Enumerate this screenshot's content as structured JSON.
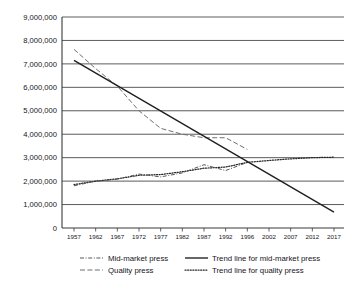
{
  "chart_data": {
    "type": "line",
    "title": "",
    "xlabel": "",
    "ylabel": "",
    "grid": "horizontal",
    "legend_position": "bottom",
    "ylim": [
      0,
      9000000
    ],
    "yticks": [
      0,
      1000000,
      2000000,
      3000000,
      4000000,
      5000000,
      6000000,
      7000000,
      8000000,
      9000000
    ],
    "ytick_labels": [
      "0",
      "1,000,000",
      "2,000,000",
      "3,000,000",
      "4,000,000",
      "5,000,000",
      "6,000,000",
      "7,000,000",
      "8,000,000",
      "9,000,000"
    ],
    "xtick_labels": [
      "1957",
      "1962",
      "1967",
      "1972",
      "1977",
      "1982",
      "1987",
      "1992",
      "1996",
      "2002",
      "2007",
      "2012",
      "2017"
    ],
    "x": [
      1957,
      1962,
      1967,
      1972,
      1977,
      1982,
      1987,
      1992,
      1996,
      2002,
      2007,
      2012,
      2017
    ],
    "series": [
      {
        "name": "Mid-market press",
        "style": "dash-dot",
        "x": [
          1957,
          1962,
          1967,
          1972,
          1977,
          1982,
          1987,
          1992,
          1996
        ],
        "values": [
          1800000,
          2000000,
          2080000,
          2300000,
          2180000,
          2350000,
          2700000,
          2450000,
          2800000
        ]
      },
      {
        "name": "Quality press",
        "style": "dashed",
        "x": [
          1957,
          1962,
          1967,
          1972,
          1977,
          1982,
          1987,
          1992,
          1996
        ],
        "values": [
          7620000,
          6800000,
          6050000,
          5000000,
          4250000,
          4000000,
          3850000,
          3850000,
          3350000
        ]
      },
      {
        "name": "Trend line for mid-market press",
        "style": "solid",
        "x": [
          1957,
          2017
        ],
        "values": [
          7150000,
          680000
        ]
      },
      {
        "name": "Trend line for quality press",
        "style": "dotted",
        "x": [
          1957,
          1962,
          1967,
          1972,
          1977,
          1982,
          1987,
          1992,
          1996,
          2002,
          2007,
          2012,
          2017
        ],
        "values": [
          1850000,
          2000000,
          2100000,
          2250000,
          2280000,
          2400000,
          2550000,
          2600000,
          2800000,
          2880000,
          2950000,
          3000000,
          3020000
        ]
      }
    ]
  },
  "legend": {
    "items": [
      {
        "label": "Mid-market press",
        "style": "dash-dot"
      },
      {
        "label": "Trend line for mid-market press",
        "style": "solid"
      },
      {
        "label": "Quality press",
        "style": "dashed"
      },
      {
        "label": "Trend line for quality press",
        "style": "dotted"
      }
    ]
  },
  "colors": {
    "grid": "#4a4a4a",
    "axis": "#3a3a3a",
    "trend_midmarket": "#1f1f22",
    "trend_quality": "#26262a",
    "series_midmarket": "#555a5e",
    "series_quality": "#6a7075",
    "background": "#ffffff"
  }
}
